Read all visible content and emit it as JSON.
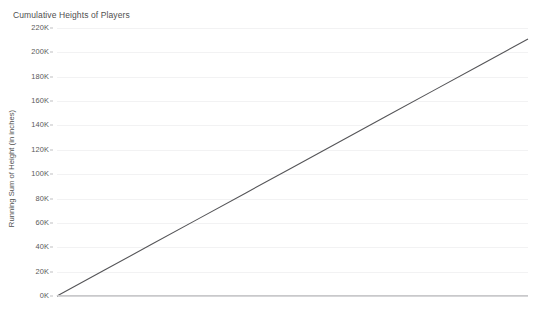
{
  "chart_data": {
    "type": "line",
    "title": "Cumulative Heights of Players",
    "xlabel": "",
    "ylabel": "Running Sum of Height (in inches)",
    "ylim": [
      0,
      220000
    ],
    "xlim": [
      0,
      100
    ],
    "grid": true,
    "legend": "none",
    "y_tick_labels": [
      "220K",
      "200K",
      "180K",
      "160K",
      "140K",
      "120K",
      "100K",
      "80K",
      "60K",
      "40K",
      "20K",
      "0K"
    ],
    "y_tick_values": [
      220000,
      200000,
      180000,
      160000,
      140000,
      120000,
      100000,
      80000,
      60000,
      40000,
      20000,
      0
    ],
    "x_tick_labels": [],
    "series": [
      {
        "name": "Running Sum of Height (in inches)",
        "color": "#555558",
        "x": [
          0,
          10,
          20,
          30,
          40,
          50,
          60,
          70,
          80,
          90,
          100
        ],
        "values": [
          0,
          21100,
          42200,
          63300,
          84400,
          105500,
          126600,
          147700,
          168800,
          189900,
          211000
        ]
      }
    ],
    "annotations": []
  },
  "axes": {
    "y_title": "Running Sum of Height (in inches)",
    "ticks": [
      {
        "label": "220K",
        "value": 220000
      },
      {
        "label": "200K",
        "value": 200000
      },
      {
        "label": "180K",
        "value": 180000
      },
      {
        "label": "160K",
        "value": 160000
      },
      {
        "label": "140K",
        "value": 140000
      },
      {
        "label": "120K",
        "value": 120000
      },
      {
        "label": "100K",
        "value": 100000
      },
      {
        "label": "80K",
        "value": 80000
      },
      {
        "label": "60K",
        "value": 60000
      },
      {
        "label": "40K",
        "value": 40000
      },
      {
        "label": "20K",
        "value": 20000
      },
      {
        "label": "0K",
        "value": 0
      }
    ]
  },
  "colors": {
    "line": "#555558",
    "gridline": "#f2f2f3",
    "axis": "#c9c9cb",
    "text": "#4f4f4f",
    "background": "#ffffff"
  }
}
